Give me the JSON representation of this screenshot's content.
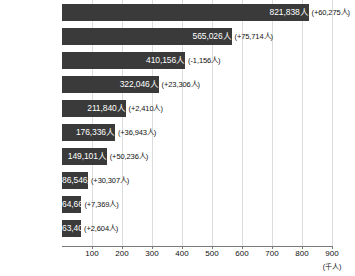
{
  "chart_data": {
    "type": "bar",
    "orientation": "horizontal",
    "title": "",
    "xlabel": "",
    "ylabel": "",
    "unit_label": "(千人)",
    "value_suffix": "人",
    "xlim": [
      0,
      900
    ],
    "xtick_values": [
      100,
      200,
      300,
      400,
      500,
      600,
      700,
      800,
      900
    ],
    "xtick_labels": [
      "100",
      "200",
      "300",
      "400",
      "500",
      "600",
      "700",
      "800",
      "900"
    ],
    "grid": true,
    "legend": "none",
    "bar_color": "#3a3a3a",
    "grid_color": "#dcdcdc",
    "axis_color": "#7a7a7a",
    "value_label_color": "#ffffff",
    "delta_label_color": "#111111",
    "categories": [
      "中国",
      "ベトナム",
      "韓国",
      "フィリピン",
      "ブラジル",
      "ネパール",
      "インドネシア",
      "ミャンマー",
      "台湾",
      "米国"
    ],
    "values": [
      821838,
      565026,
      410156,
      322046,
      211840,
      176336,
      149101,
      86546,
      64663,
      63408
    ],
    "deltas": [
      60275,
      75714,
      -1156,
      23306,
      2410,
      36943,
      50236,
      30307,
      7369,
      2604
    ],
    "rows": [
      {
        "category": "中国",
        "value": 821838,
        "value_label": "821,838人",
        "delta": 60275,
        "delta_label": "(+60,275人)"
      },
      {
        "category": "ベトナム",
        "value": 565026,
        "value_label": "565,026人",
        "delta": 75714,
        "delta_label": "(+75,714人)"
      },
      {
        "category": "韓国",
        "value": 410156,
        "value_label": "410,156人",
        "delta": -1156,
        "delta_label": "(-1,156人)"
      },
      {
        "category": "フィリピン",
        "value": 322046,
        "value_label": "322,046人",
        "delta": 23306,
        "delta_label": "(+23,306人)"
      },
      {
        "category": "ブラジル",
        "value": 211840,
        "value_label": "211,840人",
        "delta": 2410,
        "delta_label": "(+2,410人)"
      },
      {
        "category": "ネパール",
        "value": 176336,
        "value_label": "176,336人",
        "delta": 36943,
        "delta_label": "(+36,943人)"
      },
      {
        "category": "インドネシア",
        "value": 149101,
        "value_label": "149,101人",
        "delta": 50236,
        "delta_label": "(+50,236人)"
      },
      {
        "category": "ミャンマー",
        "value": 86546,
        "value_label": "86,546人",
        "delta": 30307,
        "delta_label": "(+30,307人)"
      },
      {
        "category": "台湾",
        "value": 64663,
        "value_label": "64,663人",
        "delta": 7369,
        "delta_label": "(+7,369人)"
      },
      {
        "category": "米国",
        "value": 63408,
        "value_label": "63,408人",
        "delta": 2604,
        "delta_label": "(+2,604人)"
      }
    ]
  }
}
